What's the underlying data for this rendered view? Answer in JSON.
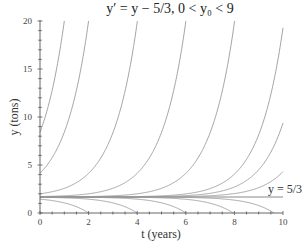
{
  "chart_data": {
    "type": "line",
    "title": "y′ = y − 5/3,    0 < y₀ < 9",
    "xlabel": "t (years)",
    "ylabel": "y (tons)",
    "xlim": [
      0,
      10
    ],
    "ylim": [
      0,
      20
    ],
    "x_major_ticks": [
      0,
      2,
      4,
      6,
      8,
      10
    ],
    "x_tick_labels": [
      "0",
      "2",
      "4",
      "6",
      "8",
      "10"
    ],
    "x_minor_step": 0.5,
    "y_major_ticks": [
      0,
      5,
      10,
      15,
      20
    ],
    "y_tick_labels": [
      "0",
      "5",
      "10",
      "15",
      "20"
    ],
    "y_minor_step": 1,
    "grid": false,
    "equation": "y = 5/3 + (y0 - 5/3) e^t",
    "equilibrium": {
      "value": 1.6667,
      "label": "y = 5/3"
    },
    "series": [
      {
        "name": "reaches 20 at t=1",
        "type": "growth",
        "y0": 8.41
      },
      {
        "name": "reaches 20 at t=2",
        "type": "growth",
        "y0": 4.15
      },
      {
        "name": "reaches 20 at t=4",
        "type": "growth",
        "y0": 2.0
      },
      {
        "name": "reaches 20 at t=6",
        "type": "growth",
        "y0": 1.712
      },
      {
        "name": "reaches 20 at t=8",
        "type": "growth",
        "y0": 1.6728
      },
      {
        "name": "reaches 20 at t=10",
        "type": "growth",
        "y0": 1.6675
      },
      {
        "name": "ends near 10 at t=10",
        "type": "growth",
        "y0": 1.66705
      },
      {
        "name": "ends near 5 at t=10",
        "type": "growth",
        "y0": 1.66682
      },
      {
        "name": "reaches 0 at t=2",
        "type": "decay",
        "y0": 1.441
      },
      {
        "name": "reaches 0 at t=4",
        "type": "decay",
        "y0": 1.636
      },
      {
        "name": "reaches 0 at t=6",
        "type": "decay",
        "y0": 1.6626
      },
      {
        "name": "reaches 0 at t=8",
        "type": "decay",
        "y0": 1.66611
      },
      {
        "name": "reaches 0 at t=10",
        "type": "decay",
        "y0": 1.66659
      }
    ]
  }
}
